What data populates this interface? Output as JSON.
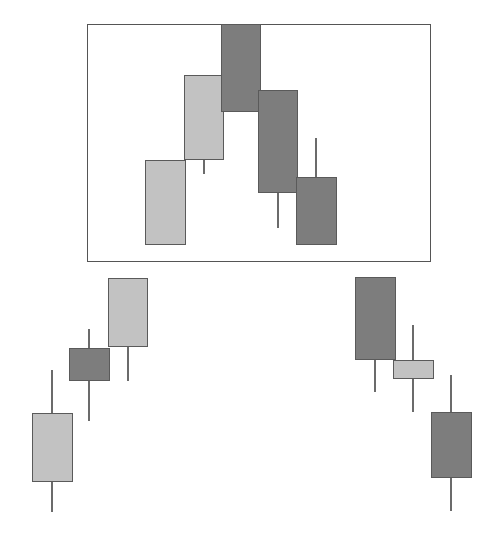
{
  "figure": {
    "background_color": "#ffffff",
    "width": 504,
    "height": 538
  },
  "colors": {
    "bullish_light": "#c2c2c2",
    "bearish_dark": "#7d7d7d",
    "outline": "#5a5a5a",
    "wick": "#6b6b6b",
    "highlight_border": "#555555"
  },
  "highlight_box": {
    "label": "pattern-highlight-box",
    "x": 87,
    "y": 24,
    "width": 344,
    "height": 238
  },
  "chart_data": {
    "type": "candlestick",
    "subtitle": "",
    "xlabel": "",
    "ylabel": "",
    "grid": false,
    "legend": "none",
    "axis_visible": false,
    "note": "Pixel-space candlestick diagram; values are screen coordinates (y grows downward). Upper rows sit inside the highlighted box; lower rows sit outside it.",
    "groups": [
      {
        "name": "inside-highlight-box",
        "candles": [
          {
            "index": 1,
            "direction": "light",
            "body_left": 145,
            "body_right": 186,
            "body_top": 160,
            "body_bottom": 245,
            "wick_x": 165,
            "wick_top": 160,
            "wick_bottom": 245
          },
          {
            "index": 2,
            "direction": "light",
            "body_left": 184,
            "body_right": 224,
            "body_top": 75,
            "body_bottom": 160,
            "wick_x": 204,
            "wick_top": 75,
            "wick_bottom": 174
          },
          {
            "index": 3,
            "direction": "dark",
            "body_left": 221,
            "body_right": 261,
            "body_top": 24,
            "body_bottom": 112,
            "wick_x": 241,
            "wick_top": 24,
            "wick_bottom": 112
          },
          {
            "index": 4,
            "direction": "dark",
            "body_left": 258,
            "body_right": 298,
            "body_top": 90,
            "body_bottom": 193,
            "wick_x": 278,
            "wick_top": 90,
            "wick_bottom": 228
          },
          {
            "index": 5,
            "direction": "dark",
            "body_left": 296,
            "body_right": 337,
            "body_top": 177,
            "body_bottom": 245,
            "wick_x": 316,
            "wick_top": 138,
            "wick_bottom": 245
          }
        ]
      },
      {
        "name": "outside-left",
        "candles": [
          {
            "index": 6,
            "direction": "light",
            "body_left": 32,
            "body_right": 73,
            "body_top": 413,
            "body_bottom": 482,
            "wick_x": 52,
            "wick_top": 370,
            "wick_bottom": 512
          },
          {
            "index": 7,
            "direction": "dark",
            "body_left": 69,
            "body_right": 110,
            "body_top": 348,
            "body_bottom": 381,
            "wick_x": 89,
            "wick_top": 329,
            "wick_bottom": 421
          },
          {
            "index": 8,
            "direction": "light",
            "body_left": 108,
            "body_right": 148,
            "body_top": 278,
            "body_bottom": 347,
            "wick_x": 128,
            "wick_top": 278,
            "wick_bottom": 381
          }
        ]
      },
      {
        "name": "outside-right",
        "candles": [
          {
            "index": 9,
            "direction": "dark",
            "body_left": 355,
            "body_right": 396,
            "body_top": 277,
            "body_bottom": 360,
            "wick_x": 375,
            "wick_top": 277,
            "wick_bottom": 392
          },
          {
            "index": 10,
            "direction": "light",
            "body_left": 393,
            "body_right": 434,
            "body_top": 360,
            "body_bottom": 379,
            "wick_x": 413,
            "wick_top": 325,
            "wick_bottom": 412
          },
          {
            "index": 11,
            "direction": "dark",
            "body_left": 431,
            "body_right": 472,
            "body_top": 412,
            "body_bottom": 478,
            "wick_x": 451,
            "wick_top": 375,
            "wick_bottom": 511
          }
        ]
      }
    ]
  }
}
